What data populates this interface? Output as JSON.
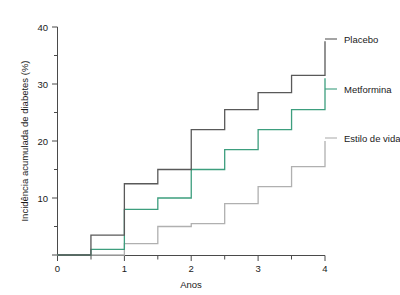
{
  "chart_data": {
    "type": "line",
    "subtype": "step",
    "title": "",
    "xlabel": "Anos",
    "ylabel": "Incidência acumulada de diabetes (%)",
    "xlim": [
      0,
      4
    ],
    "ylim": [
      0,
      40
    ],
    "x_ticks_major": [
      0,
      1,
      2,
      3,
      4
    ],
    "x_tick_labels": [
      "0",
      "1",
      "2",
      "3",
      "4"
    ],
    "x_ticks_minor": [
      0.5,
      1.5,
      2.5,
      3.5
    ],
    "y_ticks_major": [
      0,
      10,
      20,
      30,
      40
    ],
    "y_tick_labels": [
      "0",
      "10",
      "20",
      "30",
      "40"
    ],
    "y_ticks_minor": [
      5,
      15,
      25,
      35
    ],
    "grid": false,
    "legend_position": "right-inline-labels",
    "x": [
      0,
      0.5,
      1,
      1.5,
      2,
      2.5,
      3,
      3.5,
      4
    ],
    "series": [
      {
        "name": "Placebo",
        "color": "#595959",
        "label": "Placebo",
        "values": [
          0,
          3.5,
          12.5,
          15,
          22,
          25.5,
          28.5,
          31.5,
          37.5
        ],
        "label_y": 37.5
      },
      {
        "name": "Metformina",
        "color": "#3d9e7e",
        "label": "Metformina",
        "values": [
          0,
          1,
          8,
          10,
          15,
          18.5,
          22,
          25.5,
          31
        ],
        "label_y": 28.0
      },
      {
        "name": "Estilo de vida",
        "color": "#b0b0b0",
        "label": "Estilo de vida",
        "values": [
          0,
          0,
          2,
          5,
          5.5,
          9,
          12,
          15.5,
          20
        ],
        "label_y": 19.5
      }
    ]
  },
  "axis": {
    "y_title": "Incidência acumulada de diabetes (%)",
    "x_title": "Anos",
    "y_labels": [
      "40",
      "30",
      "20",
      "10",
      "0"
    ],
    "x_labels": [
      "0",
      "1",
      "2",
      "3",
      "4"
    ]
  },
  "labels": {
    "placebo": "Placebo",
    "metformina": "Metformina",
    "estilo_de_vida": "Estilo de vida"
  },
  "colors": {
    "placebo": "#595959",
    "metformina": "#3d9e7e",
    "estilo_de_vida": "#b0b0b0",
    "axis": "#4a4a4a",
    "text": "#1a1a1a",
    "background": "#ffffff"
  }
}
